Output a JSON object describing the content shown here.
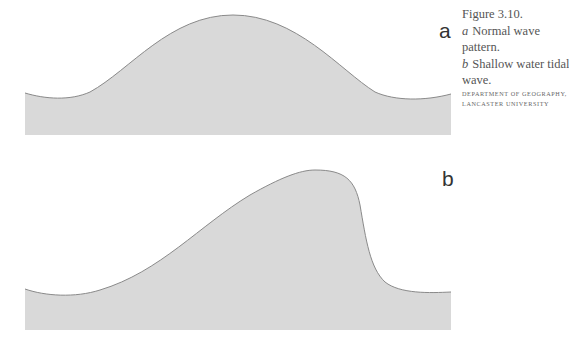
{
  "figure": {
    "number": "Figure 3.10.",
    "panels": [
      {
        "id": "a",
        "letter": "a",
        "description": "Normal wave pattern.",
        "desc_line1": "Normal wave",
        "desc_line2": "pattern."
      },
      {
        "id": "b",
        "letter": "b",
        "description": "Shallow water tidal wave.",
        "desc_line1": "Shallow water tidal",
        "desc_line2": "wave."
      }
    ],
    "credit_line1": "Department of Geography,",
    "credit_line2": "Lancaster University"
  },
  "colors": {
    "fill": "#d9d9d9",
    "stroke": "#8a8a8a",
    "label": "#333333",
    "caption": "#555555"
  }
}
